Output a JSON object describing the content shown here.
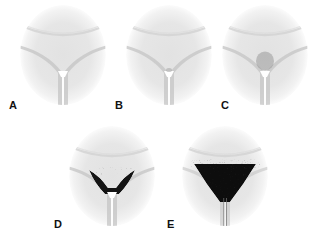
{
  "figure": {
    "type": "multi-panel-simulation-series",
    "background_color": "#ffffff",
    "panel_count": 5,
    "rows": [
      {
        "row": 1,
        "panels": [
          "A",
          "B",
          "C"
        ]
      },
      {
        "row": 2,
        "panels": [
          "D",
          "E"
        ]
      }
    ]
  },
  "colors": {
    "background": "#ffffff",
    "domain_fill": "#e4e4e4",
    "domain_edge": "#efefef",
    "wall_line": "#b8b8b8",
    "arc_line": "#cfcfcf",
    "channel_void": "#ffffff",
    "particle_dark": "#111111",
    "particle_mid": "#555555",
    "particle_light": "#9a9a9a",
    "label_color": "#111111"
  },
  "panels": [
    {
      "id": "A",
      "label": "A",
      "label_x": 9,
      "label_y": 100,
      "oval": {
        "cx": 63,
        "cy": 55,
        "rx": 43,
        "ry": 50
      },
      "accumulation": {
        "present": false,
        "density": 0.0,
        "width": 0,
        "height": 0,
        "darkness": 0.0,
        "description": "empty hopper, no particles retained above the orifice"
      },
      "stage_description": "initial state: clear V-shaped converging walls feeding a narrow vertical outlet slot"
    },
    {
      "id": "B",
      "label": "B",
      "label_x": 115,
      "label_y": 100,
      "oval": {
        "cx": 169,
        "cy": 55,
        "rx": 43,
        "ry": 50
      },
      "accumulation": {
        "present": false,
        "density": 0.02,
        "width": 4,
        "height": 3,
        "darkness": 0.15,
        "description": "essentially empty, only a trace of material at the throat"
      },
      "stage_description": "early stage: geometry unchanged, negligible retained material"
    },
    {
      "id": "C",
      "label": "C",
      "label_x": 221,
      "label_y": 100,
      "oval": {
        "cx": 265,
        "cy": 55,
        "rx": 43,
        "ry": 50
      },
      "accumulation": {
        "present": true,
        "density": 0.35,
        "width": 17,
        "height": 18,
        "darkness": 0.45,
        "description": "small loose granular cluster forming directly above the orifice"
      },
      "stage_description": "onset of arching: sparse mid-gray speckled clump bridging the outlet"
    },
    {
      "id": "D",
      "label": "D",
      "label_x": 54,
      "label_y": 219,
      "oval": {
        "cx": 112,
        "cy": 176,
        "rx": 43,
        "ry": 50
      },
      "accumulation": {
        "present": true,
        "density": 0.8,
        "width": 44,
        "height": 32,
        "darkness": 0.85,
        "description": "dense dark triangular pile filling the lower V-basin"
      },
      "stage_description": "developed blockage: compact dark wedge spanning the converging walls"
    },
    {
      "id": "E",
      "label": "E",
      "label_x": 167,
      "label_y": 219,
      "oval": {
        "cx": 225,
        "cy": 176,
        "rx": 43,
        "ry": 50
      },
      "accumulation": {
        "present": true,
        "density": 0.95,
        "width": 62,
        "height": 44,
        "darkness": 0.95,
        "description": "largest, widest and densest black wedge with a speckled tail draining down the outlet channel"
      },
      "stage_description": "full arch: broad saturated accumulation with particles trailing into the vertical channel"
    }
  ],
  "geometry": {
    "arc_label": "upper curved boundary",
    "wall_label": "converging V-shaped walls",
    "orifice_label": "outlet orifice",
    "channel_label": "vertical outlet channel"
  }
}
